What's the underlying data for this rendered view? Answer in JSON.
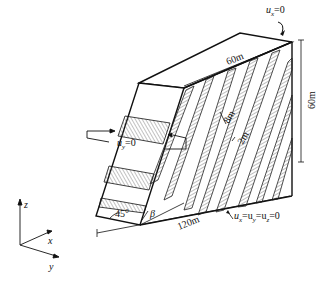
{
  "figure": {
    "type": "3D slope model with inclined joint sets",
    "labels": {
      "top_bc": "u_x=0",
      "top_bc_var": "u",
      "top_bc_sub": "x",
      "top_bc_rest": "=0",
      "left_bc_var": "u",
      "left_bc_sub": "y",
      "left_bc_rest": "=0",
      "bottom_bc_text": "u_x=u_y=u_z=0",
      "bottom_bc_parts": [
        "u",
        "x",
        "=u",
        "y",
        "=u",
        "z",
        "=0"
      ],
      "width_top": "60m",
      "height_right": "60m",
      "length_bottom": "120m",
      "joint_spacing": "8m",
      "joint_thickness": "2m",
      "slope_angle": "45°",
      "joint_angle": "β"
    },
    "axes": {
      "z": "z",
      "x": "x",
      "y": "y"
    },
    "colors": {
      "line": "#111111",
      "hatch": "#555555",
      "background": "#ffffff"
    }
  }
}
